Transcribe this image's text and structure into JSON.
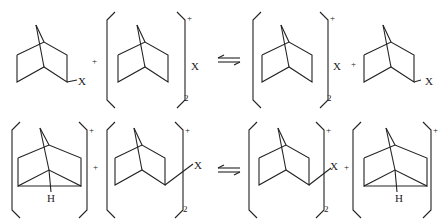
{
  "equations": [
    {
      "id": "top",
      "terms": [
        {
          "type": "neutral",
          "substituent": "X",
          "label": "2-norbornyl-X"
        },
        {
          "type": "plus",
          "label": "+"
        },
        {
          "type": "cation-bracket",
          "charge": "+",
          "subscript": "2",
          "counterion": "X",
          "label": "classical 2-norbornyl cation"
        },
        {
          "type": "equilibrium-arrow",
          "label": "⇌"
        },
        {
          "type": "cation-bracket",
          "charge": "+",
          "subscript": "2",
          "counterion": "X",
          "label": "classical 2-norbornyl cation"
        },
        {
          "type": "plus",
          "label": "+"
        },
        {
          "type": "neutral",
          "substituent": "X",
          "label": "2-norbornyl-X"
        }
      ]
    },
    {
      "id": "bottom",
      "terms": [
        {
          "type": "cation-bracket",
          "charge": "+",
          "bridging": "H",
          "label": "nonclassical (H-bridged) cation"
        },
        {
          "type": "plus",
          "label": "+"
        },
        {
          "type": "cation-bracket",
          "charge": "+",
          "subscript": "2",
          "substituent": "X",
          "label": "2-norbornyl-X cation"
        },
        {
          "type": "equilibrium-arrow",
          "label": "⇌"
        },
        {
          "type": "cation-bracket",
          "charge": "+",
          "subscript": "2",
          "substituent": "X",
          "label": "2-norbornyl-X cation"
        },
        {
          "type": "plus",
          "label": "+"
        },
        {
          "type": "cation-bracket",
          "charge": "+",
          "bridging": "H",
          "label": "nonclassical (H-bridged) cation"
        }
      ]
    }
  ],
  "labels": {
    "x": "X",
    "h": "H",
    "plus": "+",
    "charge": "+",
    "sub2": "2"
  },
  "colors": {
    "ink": "#222222",
    "background": "#ffffff"
  }
}
